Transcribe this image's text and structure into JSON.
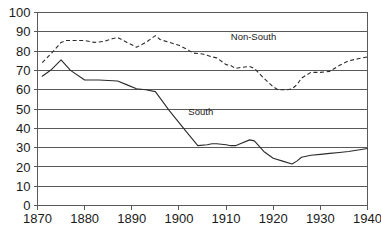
{
  "chart_data": {
    "type": "line",
    "title": "",
    "xlabel": "",
    "ylabel": "",
    "xlim": [
      1870,
      1940
    ],
    "ylim": [
      0,
      100
    ],
    "grid": true,
    "legend_position": "inline-annotation",
    "xticks": [
      1870,
      1880,
      1890,
      1900,
      1910,
      1920,
      1930,
      1940
    ],
    "xtick_labels": [
      "1870",
      "1880",
      "1890",
      "1900",
      "1910",
      "1920",
      "1930",
      "1940"
    ],
    "yticks": [
      0,
      10,
      20,
      30,
      40,
      50,
      60,
      70,
      80,
      90,
      100
    ],
    "ytick_labels": [
      "0",
      "10",
      "20",
      "30",
      "40",
      "50",
      "60",
      "70",
      "80",
      "90",
      "100"
    ],
    "annotations": [
      {
        "text": "Non-South",
        "x": 1911,
        "y": 86
      },
      {
        "text": "South",
        "x": 1902,
        "y": 47
      }
    ],
    "series": [
      {
        "name": "Non-South",
        "style": "dashed",
        "color": "#2b2b2b",
        "x": [
          1871,
          1873,
          1875,
          1876,
          1878,
          1880,
          1882,
          1884,
          1886,
          1887,
          1889,
          1891,
          1893,
          1895,
          1896,
          1898,
          1900,
          1902,
          1903,
          1905,
          1907,
          1908,
          1910,
          1911,
          1912,
          1913,
          1915,
          1916,
          1918,
          1920,
          1921,
          1923,
          1924,
          1925,
          1926,
          1928,
          1930,
          1932,
          1934,
          1936,
          1938,
          1940
        ],
        "y": [
          74.0,
          79.0,
          84.5,
          85.5,
          85.5,
          85.5,
          84.5,
          85.0,
          86.5,
          87.0,
          84.5,
          82.0,
          84.5,
          88.0,
          86.0,
          84.5,
          83.0,
          80.5,
          79.0,
          78.5,
          77.0,
          76.5,
          73.0,
          72.5,
          71.0,
          71.5,
          72.0,
          71.0,
          66.0,
          61.5,
          60.0,
          60.0,
          60.5,
          62.5,
          66.0,
          69.0,
          69.0,
          69.5,
          72.5,
          75.0,
          76.0,
          77.0
        ]
      },
      {
        "name": "South",
        "style": "solid",
        "color": "#2b2b2b",
        "x": [
          1871,
          1873,
          1875,
          1877,
          1880,
          1883,
          1885,
          1887,
          1889,
          1891,
          1893,
          1895,
          1898,
          1901,
          1904,
          1906,
          1907,
          1908,
          1910,
          1911,
          1912,
          1913,
          1915,
          1916,
          1918,
          1920,
          1922,
          1924,
          1925,
          1926,
          1928,
          1930,
          1932,
          1934,
          1936,
          1938,
          1940
        ],
        "y": [
          67.0,
          70.5,
          75.5,
          70.0,
          65.0,
          65.0,
          64.8,
          64.5,
          62.5,
          60.5,
          60.0,
          59.0,
          49.0,
          40.0,
          31.0,
          31.5,
          32.0,
          32.0,
          31.5,
          31.0,
          31.0,
          32.0,
          34.0,
          33.5,
          28.0,
          24.5,
          23.0,
          21.5,
          23.0,
          25.0,
          26.0,
          26.5,
          27.0,
          27.5,
          28.0,
          28.8,
          29.5
        ]
      }
    ]
  },
  "caption": {
    "text": ""
  }
}
